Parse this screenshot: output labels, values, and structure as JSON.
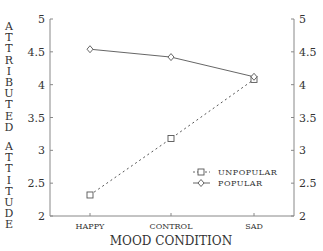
{
  "chart_data": {
    "type": "line",
    "title": "",
    "xlabel": "MOOD CONDITION",
    "ylabel": "ATTRIBUTED ATTITUDE",
    "categories": [
      "HAPPY",
      "CONTROL",
      "SAD"
    ],
    "series": [
      {
        "name": "UNPOPULAR",
        "marker": "square",
        "line": "dashed",
        "values": [
          2.32,
          3.18,
          4.08
        ]
      },
      {
        "name": "POPULAR",
        "marker": "diamond",
        "line": "solid",
        "values": [
          4.54,
          4.42,
          4.12
        ]
      }
    ],
    "ylim": [
      2,
      5
    ],
    "yticks": [
      "2",
      "2.5",
      "3",
      "3.5",
      "4",
      "4.5",
      "5"
    ],
    "yticks_right": [
      "2",
      "2.5",
      "3",
      "3.5",
      "4",
      "4.5",
      "5"
    ],
    "grid": false,
    "legend_position": "lower right inside"
  },
  "ylabel_words": [
    "ATTRIBUTED",
    "ATTITUDE"
  ],
  "colors": {
    "line": "#555555",
    "axis": "#888888",
    "text": "#333333"
  }
}
